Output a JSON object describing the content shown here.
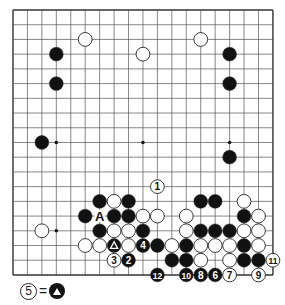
{
  "board": {
    "size": 19,
    "origin_x": 13,
    "origin_y": 10,
    "spacing_x": 14.44,
    "spacing_y": 14.72,
    "line_color": "#555555",
    "border_color": "#333333",
    "star_points": [
      [
        3,
        3
      ],
      [
        9,
        3
      ],
      [
        15,
        3
      ],
      [
        3,
        9
      ],
      [
        9,
        9
      ],
      [
        15,
        9
      ],
      [
        3,
        15
      ],
      [
        9,
        15
      ],
      [
        15,
        15
      ]
    ],
    "stones": {
      "black": [
        {
          "c": 3,
          "r": 3
        },
        {
          "c": 3,
          "r": 5
        },
        {
          "c": 15,
          "r": 3
        },
        {
          "c": 15,
          "r": 5
        },
        {
          "c": 2,
          "r": 9
        },
        {
          "c": 15,
          "r": 10
        },
        {
          "c": 6,
          "r": 13
        },
        {
          "c": 8,
          "r": 13
        },
        {
          "c": 13,
          "r": 13
        },
        {
          "c": 14,
          "r": 13
        },
        {
          "c": 5,
          "r": 14
        },
        {
          "c": 7,
          "r": 14
        },
        {
          "c": 8,
          "r": 14
        },
        {
          "c": 16,
          "r": 14
        },
        {
          "c": 6,
          "r": 15
        },
        {
          "c": 9,
          "r": 15
        },
        {
          "c": 13,
          "r": 15
        },
        {
          "c": 14,
          "r": 15
        },
        {
          "c": 15,
          "r": 15
        },
        {
          "c": 7,
          "r": 16,
          "mark": "triangle"
        },
        {
          "c": 9,
          "r": 16,
          "label": "4"
        },
        {
          "c": 10,
          "r": 16
        },
        {
          "c": 12,
          "r": 16
        },
        {
          "c": 16,
          "r": 16
        },
        {
          "c": 8,
          "r": 17,
          "label": "2"
        },
        {
          "c": 11,
          "r": 17
        },
        {
          "c": 12,
          "r": 17
        },
        {
          "c": 16,
          "r": 17
        },
        {
          "c": 17,
          "r": 17
        },
        {
          "c": 10,
          "r": 18,
          "label": "12"
        },
        {
          "c": 12,
          "r": 18,
          "label": "10"
        },
        {
          "c": 13,
          "r": 18,
          "label": "8"
        },
        {
          "c": 14,
          "r": 18,
          "label": "6"
        }
      ],
      "white": [
        {
          "c": 5,
          "r": 2
        },
        {
          "c": 13,
          "r": 2
        },
        {
          "c": 9,
          "r": 3
        },
        {
          "c": 2,
          "r": 15
        },
        {
          "c": 10,
          "r": 12,
          "label": "1"
        },
        {
          "c": 7,
          "r": 13
        },
        {
          "c": 16,
          "r": 13
        },
        {
          "c": 9,
          "r": 14
        },
        {
          "c": 10,
          "r": 14
        },
        {
          "c": 12,
          "r": 14
        },
        {
          "c": 17,
          "r": 14
        },
        {
          "c": 7,
          "r": 15
        },
        {
          "c": 8,
          "r": 15
        },
        {
          "c": 12,
          "r": 15
        },
        {
          "c": 16,
          "r": 15
        },
        {
          "c": 17,
          "r": 15
        },
        {
          "c": 5,
          "r": 16
        },
        {
          "c": 6,
          "r": 16
        },
        {
          "c": 8,
          "r": 16
        },
        {
          "c": 11,
          "r": 16
        },
        {
          "c": 13,
          "r": 16
        },
        {
          "c": 14,
          "r": 16
        },
        {
          "c": 15,
          "r": 16
        },
        {
          "c": 17,
          "r": 16
        },
        {
          "c": 7,
          "r": 17,
          "label": "3"
        },
        {
          "c": 13,
          "r": 17
        },
        {
          "c": 15,
          "r": 17
        },
        {
          "c": 18,
          "r": 17,
          "label": "11"
        },
        {
          "c": 15,
          "r": 18,
          "label": "7"
        },
        {
          "c": 17,
          "r": 18,
          "label": "9"
        }
      ]
    },
    "point_labels": [
      {
        "c": 6,
        "r": 14,
        "text": "A"
      }
    ]
  },
  "caption": {
    "move_number": "5",
    "equals": "=",
    "target": "black-stone-with-triangle"
  }
}
